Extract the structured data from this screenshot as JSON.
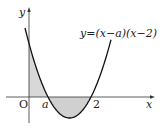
{
  "figure": {
    "equation": "y=(x−a)(x−2)",
    "axis_x_label": "x",
    "axis_y_label": "y",
    "origin_label": "O",
    "root_a_label": "a",
    "root_2_label": "2",
    "colors": {
      "curve": "#111111",
      "axis": "#333333",
      "shade": "#d3d3d3"
    }
  }
}
